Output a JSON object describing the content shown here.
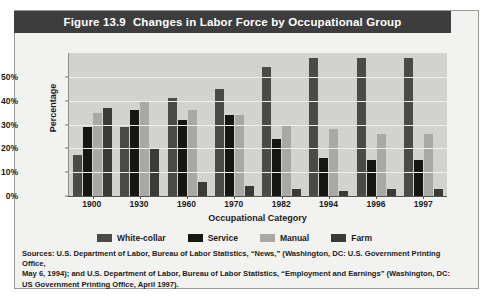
{
  "figure": {
    "number": "Figure 13.9",
    "title": "Changes in Labor Force by Occupational Group"
  },
  "chart_data": {
    "type": "bar",
    "title": "Figure 13.9  Changes in Labor Force by Occupational Group",
    "xlabel": "Occupational Category",
    "ylabel": "Percentage",
    "ylim": [
      0,
      60
    ],
    "yticks": [
      "0%",
      "10%",
      "20%",
      "30%",
      "40%",
      "50%"
    ],
    "ytick_values": [
      0,
      10,
      20,
      30,
      40,
      50
    ],
    "grid": true,
    "legend_position": "bottom",
    "categories": [
      "1900",
      "1930",
      "1960",
      "1970",
      "1982",
      "1994",
      "1996",
      "1997"
    ],
    "series": [
      {
        "name": "White-collar",
        "color": "#4a4a48",
        "values": [
          17,
          29,
          41,
          45,
          54,
          58,
          58,
          58
        ]
      },
      {
        "name": "Service",
        "color": "#161614",
        "values": [
          29,
          36,
          32,
          34,
          24,
          16,
          15,
          15
        ]
      },
      {
        "name": "Manual",
        "color": "#a8a8a4",
        "values": [
          35,
          40,
          36,
          34,
          30,
          28,
          26,
          26
        ]
      },
      {
        "name": "Farm",
        "color": "#3a3a38",
        "values": [
          37,
          20,
          6,
          4,
          3,
          2,
          3,
          3
        ]
      }
    ]
  },
  "source": {
    "line1": "Sources: U.S. Department of Labor, Bureau of Labor Statistics, “News,” (Washington, DC: U.S. Government Printing Office,",
    "line2": "May 6, 1994); and U.S. Department of Labor, Bureau of Labor Statistics, “Employment and Earnings” (Washington, DC:",
    "line3": "US Government Printing Office, April 1997)."
  }
}
